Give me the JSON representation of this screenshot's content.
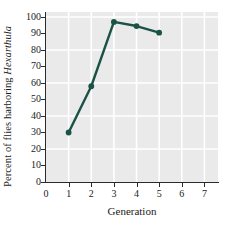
{
  "chart_data": {
    "type": "line",
    "title": "",
    "xlabel": "Generation",
    "ylabel_prefix": "Percent of flies harboring ",
    "ylabel_species": "Hexarthula",
    "ylabel_full": "Percent of flies harboring Hexarthula",
    "x": [
      1,
      2,
      3,
      4,
      5
    ],
    "values": [
      30,
      58,
      97,
      94.5,
      90.5
    ],
    "series": [
      {
        "name": "Percent of flies harboring Hexarthula",
        "x": [
          1,
          2,
          3,
          4,
          5
        ],
        "values": [
          30,
          58,
          97,
          94.5,
          90.5
        ]
      }
    ],
    "xlim": [
      0,
      7.6
    ],
    "ylim": [
      0,
      103
    ],
    "xticks": [
      0,
      1,
      2,
      3,
      4,
      5,
      6,
      7
    ],
    "yticks": [
      0,
      10,
      20,
      30,
      40,
      50,
      60,
      70,
      80,
      90,
      100
    ],
    "xtick_labels": [
      "0",
      "1",
      "2",
      "3",
      "4",
      "5",
      "6",
      "7"
    ],
    "ytick_labels": [
      "0",
      "10",
      "20",
      "30",
      "40",
      "50",
      "60",
      "70",
      "80",
      "90",
      "100"
    ],
    "y_gridlines": [
      20,
      40,
      60,
      80,
      100
    ],
    "x_gridlines": [
      1,
      2,
      3,
      4,
      5,
      6,
      7
    ],
    "grid": true,
    "legend": false,
    "legend_position": "none",
    "marker": "circle",
    "colors": {
      "line": "#1a5245",
      "marker": "#1a5245",
      "plot_background": "#eaeaea",
      "gridline": "#ffffff",
      "axis": "#2b2b2b",
      "text": "#1a1a1a",
      "figure_background": "#ffffff"
    }
  }
}
